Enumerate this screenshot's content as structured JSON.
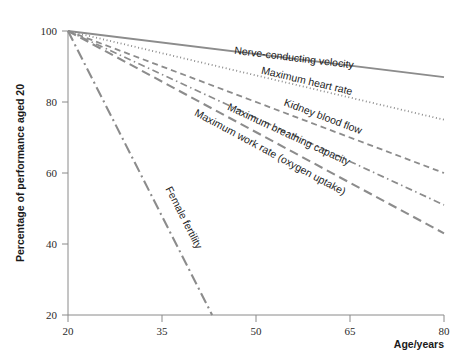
{
  "chart_data": {
    "type": "line",
    "title": "",
    "subtitle": "",
    "xlabel": "Age/years",
    "ylabel": "Percentage of performance aged 20",
    "xlim": [
      20,
      80
    ],
    "ylim": [
      20,
      100
    ],
    "xticks": [
      "20",
      "35",
      "50",
      "65",
      "80"
    ],
    "xtick_values": [
      20,
      35,
      50,
      65,
      80
    ],
    "yticks": [
      "20",
      "40",
      "60",
      "80",
      "100"
    ],
    "ytick_values": [
      20,
      40,
      60,
      80,
      100
    ],
    "grid": false,
    "legend": "inline-labels-on-lines",
    "x": [
      20,
      80
    ],
    "series": [
      {
        "name": "Nerve-conducting velocity",
        "label": "Nerve-conducting velocity",
        "values": [
          100,
          87
        ],
        "x": [
          20,
          80
        ],
        "style": "solid",
        "color": "#8c8c8c",
        "label_x": 56,
        "label_y": 91.5
      },
      {
        "name": "Maximum heart rate",
        "label": "Maximum heart rate",
        "values": [
          100,
          75
        ],
        "x": [
          20,
          80
        ],
        "style": "dotted",
        "color": "#8c8c8c",
        "label_x": 58,
        "label_y": 85
      },
      {
        "name": "Kidney blood flow",
        "label": "Kidney blood flow",
        "values": [
          100,
          60
        ],
        "x": [
          20,
          80
        ],
        "style": "dashed",
        "color": "#8c8c8c",
        "label_x": 60.5,
        "label_y": 75
      },
      {
        "name": "Maximum breathing capacity",
        "label": "Maximum breathing capacity",
        "values": [
          100,
          51
        ],
        "x": [
          20,
          80
        ],
        "style": "dash-dot",
        "color": "#8c8c8c",
        "label_x": 55,
        "label_y": 70
      },
      {
        "name": "Maximum work rate (oxygen uptake)",
        "label": "Maximum work rate (oxygen uptake)",
        "values": [
          100,
          43
        ],
        "x": [
          20,
          80
        ],
        "style": "long-dash",
        "color": "#8c8c8c",
        "label_x": 52,
        "label_y": 65
      },
      {
        "name": "Female fertility",
        "label": "Female fertility",
        "values": [
          100,
          20
        ],
        "x": [
          20,
          43
        ],
        "style": "long-dash-dot",
        "color": "#8c8c8c",
        "label_x": 38,
        "label_y": 47
      }
    ]
  }
}
